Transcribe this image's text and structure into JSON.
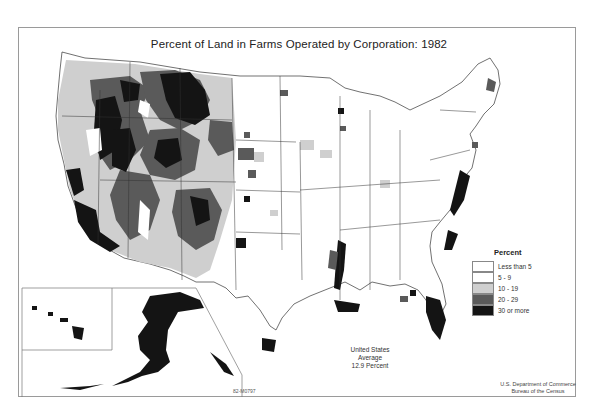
{
  "map": {
    "title": "Percent of Land in Farms Operated by Corporation: 1982",
    "average": {
      "line1": "United States",
      "line2": "Average",
      "line3": "12.9 Percent",
      "value_percent": 12.9
    },
    "source": {
      "line1": "U.S. Department of Commerce",
      "line2": "Bureau of the Census"
    },
    "map_code": "82-M0797",
    "insets": [
      "Alaska",
      "Hawaii"
    ]
  },
  "legend": {
    "title": "Percent",
    "items": [
      {
        "label": "Less than 5",
        "color": "#ffffff"
      },
      {
        "label": "5 - 9",
        "color": "#ffffff"
      },
      {
        "label": "10 - 19",
        "color": "#cfcfcf"
      },
      {
        "label": "20 - 29",
        "color": "#5a5a5a"
      },
      {
        "label": "30 or more",
        "color": "#141414"
      }
    ]
  },
  "colors": {
    "state_border": "#333333",
    "frame": "#9a9a9a",
    "low": "#ffffff",
    "mid": "#cfcfcf",
    "high": "#5a5a5a",
    "top": "#141414"
  }
}
